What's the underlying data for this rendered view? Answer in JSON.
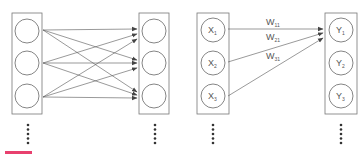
{
  "diagram_left": {
    "title": "",
    "input_layer": {
      "nodes": [
        "",
        "",
        ""
      ]
    },
    "output_layer": {
      "nodes": [
        "",
        "",
        ""
      ]
    },
    "connections": "fully-connected"
  },
  "diagram_right": {
    "input_layer": {
      "nodes": [
        "X",
        "X",
        "X"
      ],
      "subscripts": [
        "1",
        "2",
        "3"
      ]
    },
    "output_layer": {
      "nodes": [
        "Y",
        "Y",
        "Y"
      ],
      "subscripts": [
        "1",
        "2",
        "3"
      ]
    },
    "weights": [
      {
        "label": "W",
        "sub": "11"
      },
      {
        "label": "W",
        "sub": "21"
      },
      {
        "label": "W",
        "sub": "31"
      }
    ]
  },
  "caption": {
    "text": "",
    "accent_color": "#e8406e"
  },
  "colors": {
    "stroke": "#666666",
    "text": "#555555"
  }
}
